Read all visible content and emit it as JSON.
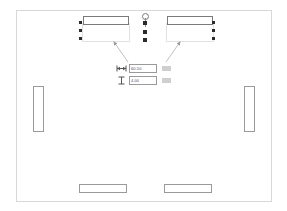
{
  "app": {
    "view_name": "floor-plan-canvas",
    "background_color": "#ffffff",
    "frame_color": "#d8d8d8",
    "wall_color": "#9a9a9a",
    "handle_color": "#2b2b2b"
  },
  "room": {
    "label": "room-outline",
    "walls": [
      {
        "id": "wall-top-left",
        "label": "Top Left Wall",
        "selected": true,
        "orientation": "horizontal"
      },
      {
        "id": "wall-top-right",
        "label": "Top Right Wall",
        "selected": true,
        "orientation": "horizontal"
      },
      {
        "id": "wall-left",
        "label": "Left Wall",
        "selected": false,
        "orientation": "vertical"
      },
      {
        "id": "wall-right",
        "label": "Right Wall",
        "selected": false,
        "orientation": "vertical"
      },
      {
        "id": "wall-bottom-left",
        "label": "Bottom Left Wall",
        "selected": false,
        "orientation": "horizontal"
      },
      {
        "id": "wall-bottom-right",
        "label": "Bottom Right Wall",
        "selected": false,
        "orientation": "horizontal"
      }
    ]
  },
  "selection": {
    "rotate_handle": "rotate-handle",
    "grip_count_per_side": 3
  },
  "dimension_panel": {
    "length": {
      "icon": "horizontal-dimension-icon",
      "value": "60.50",
      "placeholder": "0.00",
      "unit_label": ""
    },
    "thickness": {
      "icon": "wall-thickness-icon",
      "value": "4.00",
      "placeholder": "0.00",
      "unit_label": ""
    }
  },
  "leaders": [
    {
      "id": "leader-left",
      "label": "pointer to top-left wall"
    },
    {
      "id": "leader-right",
      "label": "pointer to top-right wall"
    }
  ]
}
